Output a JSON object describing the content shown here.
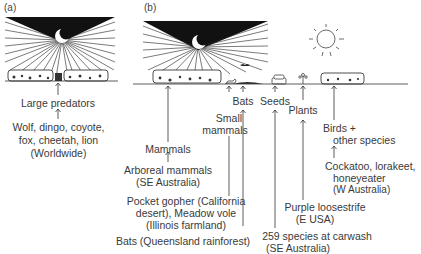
{
  "panels": {
    "a": {
      "label": "(a)",
      "chain": [
        {
          "text": "Large predators"
        },
        {
          "line1": "Wolf, dingo, coyote,",
          "line2": "fox, cheetah, lion",
          "line3": "(Worldwide)"
        }
      ]
    },
    "b": {
      "label": "(b)",
      "groups": {
        "mammals": "Mammals",
        "arboreal_line1": "Arboreal mammals",
        "arboreal_line2": "(SE Australia)",
        "small_line1": "Small",
        "small_line2": "mammals",
        "pocket_line1": "Pocket gopher (California",
        "pocket_line2": "desert), Meadow vole",
        "pocket_line3": "(Illinois farmland)",
        "bats": "Bats",
        "bats_example": "Bats (Queensland rainforest)",
        "seeds": "Seeds",
        "seeds_line1": "259 species at carwash",
        "seeds_line2": "(SE Australia)",
        "plants": "Plants",
        "plants_line1": "Purple loosestrife",
        "plants_line2": "(E USA)",
        "birds_line1": "Birds +",
        "birds_line2": "other species",
        "birds_ex1": "Cockatoo, lorakeet,",
        "birds_ex2": "honeyeater",
        "birds_ex3": "(W Australia)"
      }
    }
  },
  "icons": [
    "moon-icon",
    "sun-icon",
    "light-rays",
    "vegetation-patch",
    "car-icon",
    "flower-icon",
    "animal-icon",
    "bat-icon"
  ]
}
